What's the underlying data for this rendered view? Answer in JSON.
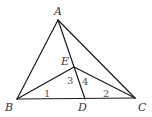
{
  "diagram": {
    "type": "geometry-triangle",
    "points": {
      "A": {
        "label": "A",
        "x": 58,
        "y": 20
      },
      "B": {
        "label": "B",
        "x": 17,
        "y": 99
      },
      "C": {
        "label": "C",
        "x": 135,
        "y": 98
      },
      "D": {
        "label": "D",
        "x": 85,
        "y": 99
      },
      "E": {
        "label": "E",
        "x": 74,
        "y": 67
      }
    },
    "segments": [
      "AB",
      "AC",
      "BC",
      "AD",
      "BE",
      "CE"
    ],
    "angle_labels": [
      "1",
      "2",
      "3",
      "4"
    ]
  }
}
